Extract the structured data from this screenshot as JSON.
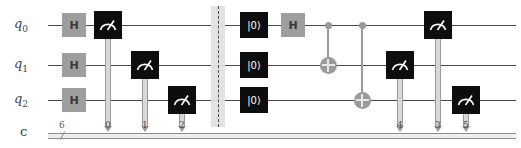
{
  "diagram": {
    "type": "quantum-circuit",
    "wires": [
      {
        "id": "q0",
        "label": "q",
        "sub": "0",
        "y": 25
      },
      {
        "id": "q1",
        "label": "q",
        "sub": "1",
        "y": 65
      },
      {
        "id": "q2",
        "label": "q",
        "sub": "2",
        "y": 100
      }
    ],
    "classical": {
      "label": "c",
      "y": 133,
      "size": "6",
      "x_start": 48,
      "x_end": 516
    },
    "wire_x_start": 48,
    "wire_x_end": 516
  },
  "gates": {
    "hadamard_label": "H",
    "reset_label": "|0⟩",
    "items": [
      {
        "name": "hadamard-gate",
        "kind": "h",
        "wire": "q0",
        "x": 62,
        "label": "H"
      },
      {
        "name": "hadamard-gate",
        "kind": "h",
        "wire": "q1",
        "x": 62,
        "label": "H"
      },
      {
        "name": "hadamard-gate",
        "kind": "h",
        "wire": "q2",
        "x": 62,
        "label": "H"
      },
      {
        "name": "measure-gate",
        "kind": "measure",
        "wire": "q0",
        "x": 94,
        "cbit": "0"
      },
      {
        "name": "measure-gate",
        "kind": "measure",
        "wire": "q1",
        "x": 131,
        "cbit": "1"
      },
      {
        "name": "measure-gate",
        "kind": "measure",
        "wire": "q2",
        "x": 168,
        "cbit": "2"
      },
      {
        "name": "barrier",
        "kind": "barrier",
        "wire": "all",
        "x": 218
      },
      {
        "name": "reset-gate",
        "kind": "reset",
        "wire": "q0",
        "x": 240,
        "label": "|0⟩"
      },
      {
        "name": "reset-gate",
        "kind": "reset",
        "wire": "q1",
        "x": 240,
        "label": "|0⟩"
      },
      {
        "name": "reset-gate",
        "kind": "reset",
        "wire": "q2",
        "x": 240,
        "label": "|0⟩"
      },
      {
        "name": "hadamard-gate",
        "kind": "h",
        "wire": "q0",
        "x": 281,
        "label": "H"
      },
      {
        "name": "cnot-gate",
        "kind": "cnot",
        "control": "q0",
        "target": "q1",
        "x": 328
      },
      {
        "name": "cnot-gate",
        "kind": "cnot",
        "control": "q0",
        "target": "q2",
        "x": 362
      },
      {
        "name": "measure-gate",
        "kind": "measure",
        "wire": "q1",
        "x": 386,
        "cbit": "4"
      },
      {
        "name": "measure-gate",
        "kind": "measure",
        "wire": "q0",
        "x": 424,
        "cbit": "3"
      },
      {
        "name": "measure-gate",
        "kind": "measure",
        "wire": "q2",
        "x": 452,
        "cbit": "5"
      }
    ]
  },
  "classical_bit_markers": [
    {
      "index": "0",
      "x": 105
    },
    {
      "index": "1",
      "x": 142
    },
    {
      "index": "2",
      "x": 179
    },
    {
      "index": "4",
      "x": 397
    },
    {
      "index": "3",
      "x": 435
    },
    {
      "index": "5",
      "x": 463
    }
  ],
  "colors": {
    "wire": "#4a4a4a",
    "hadamard_fill": "#9e9e9e",
    "measure_fill": "#0d0d0d",
    "reset_fill": "#0d0d0d",
    "cnot_fill": "#9a9a9a",
    "barrier_band": "#e2e2e2",
    "classical_wire": "#8d8d8d",
    "background": "#ffffff"
  }
}
